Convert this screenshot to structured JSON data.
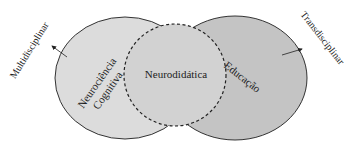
{
  "diagram": {
    "type": "venn",
    "sets": [
      {
        "id": "neurociencia",
        "label_lines": [
          "Neurociência",
          "Cognitiva"
        ],
        "fill": "#dcdcdc"
      },
      {
        "id": "educacao",
        "label": "Educação",
        "fill": "#c4c4c4"
      },
      {
        "id": "neurodidatica",
        "label": "Neurodidática",
        "fill": "#cfcfcf",
        "border": "dashed"
      }
    ],
    "arrows": [
      {
        "label": "Multidisciplinar",
        "direction": "up-left"
      },
      {
        "label": "Transdisciplinar",
        "direction": "up-right"
      }
    ],
    "colors": {
      "stroke": "#333333",
      "left_fill": "#dcdcdc",
      "right_fill": "#c4c4c4",
      "center_fill": "#d0d0d0",
      "text": "#222222"
    }
  }
}
